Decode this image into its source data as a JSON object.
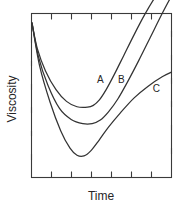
{
  "chart_data": {
    "type": "line",
    "title": "",
    "xlabel": "Time",
    "ylabel": "Viscosity",
    "grid": false,
    "legend": "inline-curve-labels",
    "xlim": [
      0,
      6
    ],
    "ylim": [
      0,
      7
    ],
    "xticks": [
      "",
      "",
      "",
      "",
      "",
      ""
    ],
    "yticks": [
      "",
      "",
      "",
      "",
      "",
      "",
      ""
    ],
    "axis_tick_labels_shown": false,
    "annotations": [
      {
        "text": "A",
        "x": 2.95,
        "y": 4.05
      },
      {
        "text": "B",
        "x": 3.85,
        "y": 4.05
      },
      {
        "text": "C",
        "x": 5.35,
        "y": 3.65
      }
    ],
    "series": [
      {
        "name": "A",
        "label": "A",
        "description": "steepest rise, deepest minimum",
        "x": [
          0.02,
          0.25,
          0.6,
          1.05,
          1.5,
          1.95,
          2.4,
          2.65,
          2.9,
          3.2,
          3.55,
          3.95,
          4.4,
          4.85,
          5.3,
          5.6
        ],
        "y": [
          6.6,
          5.5,
          4.55,
          3.75,
          3.25,
          3.02,
          3.0,
          3.08,
          3.3,
          3.75,
          4.4,
          5.2,
          6.1,
          6.95,
          7.7,
          8.1
        ]
      },
      {
        "name": "B",
        "label": "B",
        "description": "intermediate minimum and rise",
        "x": [
          0.02,
          0.3,
          0.7,
          1.2,
          1.7,
          2.2,
          2.6,
          2.95,
          3.3,
          3.7,
          4.1,
          4.6,
          5.1,
          5.6,
          6.0
        ],
        "y": [
          6.6,
          5.15,
          3.95,
          2.95,
          2.48,
          2.3,
          2.3,
          2.45,
          2.8,
          3.35,
          4.05,
          5.0,
          6.0,
          7.0,
          7.75
        ]
      },
      {
        "name": "C",
        "label": "C",
        "description": "deepest and narrowest minimum, shallowest final rise",
        "x": [
          0.02,
          0.35,
          0.8,
          1.25,
          1.65,
          1.95,
          2.25,
          2.55,
          2.9,
          3.3,
          3.8,
          4.4,
          5.0,
          5.6,
          6.0
        ],
        "y": [
          6.6,
          4.75,
          3.2,
          2.0,
          1.25,
          0.95,
          0.92,
          1.15,
          1.6,
          2.15,
          2.75,
          3.4,
          3.9,
          4.3,
          4.5
        ]
      }
    ]
  },
  "figure": {
    "y_axis_title": "Viscosity",
    "x_axis_title": "Time",
    "curve_labels": {
      "a": "A",
      "b": "B",
      "c": "C"
    },
    "colors": {
      "background": "#ffffff",
      "axis": "#3a3a3a",
      "curve": "#333333",
      "text": "#262626"
    }
  }
}
